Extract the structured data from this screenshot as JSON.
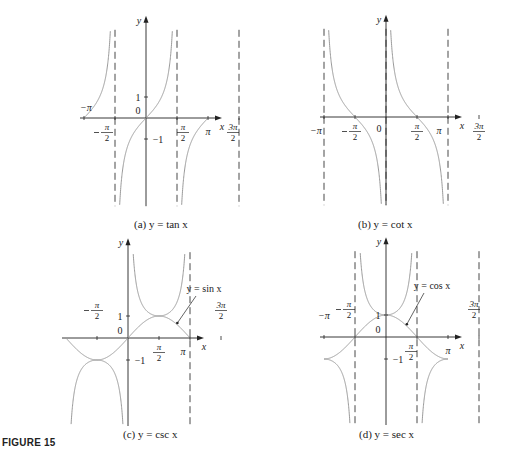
{
  "figure_label": "FIGURE 15",
  "colors": {
    "axis": "#222222",
    "curve": "#9a9a9a",
    "asymptote": "#333333",
    "text": "#222222"
  },
  "chart_data": [
    {
      "type": "line",
      "id": "a",
      "title": "(a) y = tan x",
      "function": "tan",
      "xlabel": "x",
      "ylabel": "y",
      "x_ticks": [
        "−π",
        "−π/2",
        "π/2",
        "π",
        "3π/2"
      ],
      "y_ticks": [
        "1",
        "0",
        "−1"
      ],
      "asymptotes": [
        "−π/2",
        "π/2",
        "3π/2"
      ],
      "xlim": [
        "−1.4π",
        "1.7π"
      ],
      "ylim": [
        -4.2,
        4.2
      ],
      "grid": false,
      "origin_px": [
        146,
        118
      ],
      "half_pi_px": 31,
      "unit_px": 21,
      "caption_px": [
        134,
        222
      ]
    },
    {
      "type": "line",
      "id": "b",
      "title": "(b) y = cot x",
      "function": "cot",
      "xlabel": "x",
      "ylabel": "y",
      "x_ticks": [
        "−π",
        "−π/2",
        "0",
        "π/2",
        "π",
        "3π/2"
      ],
      "y_ticks": [],
      "asymptotes": [
        "−π",
        "0",
        "π"
      ],
      "xlim": [
        "−1.2π",
        "1.7π"
      ],
      "ylim": [
        -4.2,
        4.2
      ],
      "grid": false,
      "origin_px": [
        386,
        117
      ],
      "half_pi_px": 31,
      "unit_px": 21,
      "caption_px": [
        358,
        222
      ]
    },
    {
      "type": "line",
      "id": "c",
      "title": "(c) y = csc x",
      "function": "csc",
      "overlay": {
        "function": "sin",
        "label": "y = sin x"
      },
      "xlabel": "x",
      "ylabel": "y",
      "x_ticks": [
        "−π/2",
        "π/2",
        "π",
        "3π/2"
      ],
      "y_ticks": [
        "1",
        "0",
        "−1"
      ],
      "asymptotes": [
        "π"
      ],
      "xlim": [
        "−0.7π",
        "1.7π"
      ],
      "ylim": [
        -4,
        3.9
      ],
      "grid": false,
      "origin_px": [
        128,
        338
      ],
      "half_pi_px": 31,
      "unit_px": 22,
      "caption_px": [
        123,
        432
      ]
    },
    {
      "type": "line",
      "id": "d",
      "title": "(d) y = sec x",
      "function": "sec",
      "overlay": {
        "function": "cos",
        "label": "y = cos x"
      },
      "xlabel": "x",
      "ylabel": "y",
      "x_ticks": [
        "−π",
        "−π/2",
        "π/2",
        "π",
        "3π/2"
      ],
      "y_ticks": [
        "1",
        "0",
        "−1"
      ],
      "asymptotes": [
        "−π/2",
        "π/2",
        "3π/2"
      ],
      "xlim": [
        "−1.2π",
        "1.7π"
      ],
      "ylim": [
        -4,
        3.9
      ],
      "grid": false,
      "origin_px": [
        386,
        337
      ],
      "half_pi_px": 31,
      "unit_px": 22,
      "caption_px": [
        359,
        432
      ]
    }
  ]
}
